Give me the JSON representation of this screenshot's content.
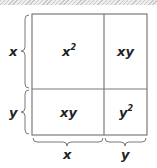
{
  "diagram": {
    "colors": {
      "border": "#7a7a7a",
      "text": "#222222",
      "hatch": "#c8c8c8"
    },
    "square": {
      "left": 32,
      "top": 14,
      "right": 147,
      "bottom": 135,
      "divider_x": 104,
      "divider_y": 89
    },
    "cells": [
      {
        "id": "top-left",
        "base": "x",
        "exp": "2"
      },
      {
        "id": "top-right",
        "base": "xy",
        "exp": ""
      },
      {
        "id": "bottom-left",
        "base": "xy",
        "exp": ""
      },
      {
        "id": "bottom-right",
        "base": "y",
        "exp": "2"
      }
    ],
    "side_labels": {
      "left_top": "x",
      "left_bottom": "y",
      "bottom_left": "x",
      "bottom_right": "y"
    }
  }
}
